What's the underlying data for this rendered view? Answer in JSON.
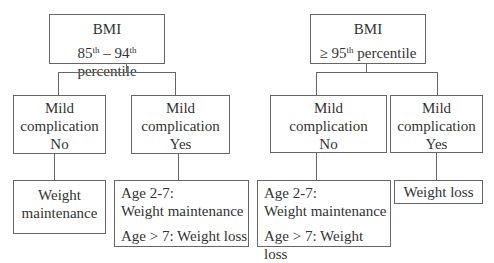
{
  "left_tree": {
    "root": {
      "title": "BMI",
      "range_a": "85",
      "sup_a": "th",
      "dash": " – ",
      "range_b": "94",
      "sup_b": "th",
      "suffix": " percentile"
    },
    "branch_no": {
      "line1": "Mild",
      "line2": "complication",
      "line3": "No"
    },
    "branch_yes": {
      "line1": "Mild",
      "line2": "complication",
      "line3": "Yes"
    },
    "outcome_no": {
      "line1": "Weight",
      "line2": "maintenance"
    },
    "outcome_yes": {
      "line1": "Age 2-7:",
      "line2": "Weight maintenance",
      "line3": "Age > 7: Weight loss"
    }
  },
  "right_tree": {
    "root": {
      "title": "BMI",
      "prefix": "≥ 95",
      "sup": "th",
      "suffix": " percentile"
    },
    "branch_no": {
      "line1": "Mild",
      "line2": "complication",
      "line3": "No"
    },
    "branch_yes": {
      "line1": "Mild",
      "line2": "complication",
      "line3": "Yes"
    },
    "outcome_no": {
      "line1": "Age 2-7:",
      "line2": "Weight maintenance",
      "line3": "Age > 7: Weight loss"
    },
    "outcome_yes": {
      "line1": "Weight loss"
    }
  }
}
